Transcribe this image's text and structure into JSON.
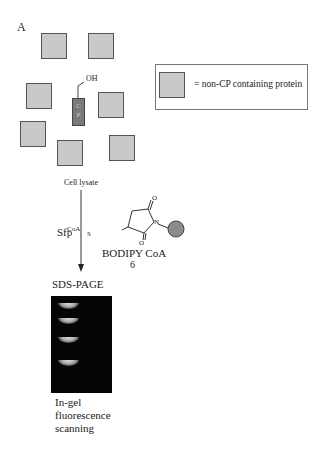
{
  "panel_label": "A",
  "legend": {
    "text": "= non-CP containing protein"
  },
  "proteins": [
    {
      "x": 41,
      "y": 33
    },
    {
      "x": 88,
      "y": 33
    },
    {
      "x": 26,
      "y": 83
    },
    {
      "x": 98,
      "y": 92
    },
    {
      "x": 20,
      "y": 121
    },
    {
      "x": 109,
      "y": 135
    },
    {
      "x": 57,
      "y": 140
    }
  ],
  "carrier_protein": {
    "label_line1": "C",
    "label_line2": "P",
    "hydroxyl": "OH"
  },
  "labels": {
    "cell_lysate": "Cell lysate",
    "enzyme": "Sfp",
    "sds_page": "SDS-PAGE",
    "probe_name": "BODIPY CoA",
    "probe_number": "6",
    "readout_line1": "In-gel",
    "readout_line2": "fluorescence",
    "readout_line3": "scanning"
  },
  "structure": {
    "coa": "CoA",
    "sulfur": "S",
    "nitrogen": "N",
    "oxygen_top": "O",
    "oxygen_bottom": "O"
  },
  "gel": {
    "bands_y": [
      7,
      22,
      41,
      64
    ]
  },
  "colors": {
    "protein_fill": "#c9c9c9",
    "cp_fill": "#7a7a7a",
    "gel_bg": "#050505",
    "bodipy_fill": "#8c8c8c"
  }
}
